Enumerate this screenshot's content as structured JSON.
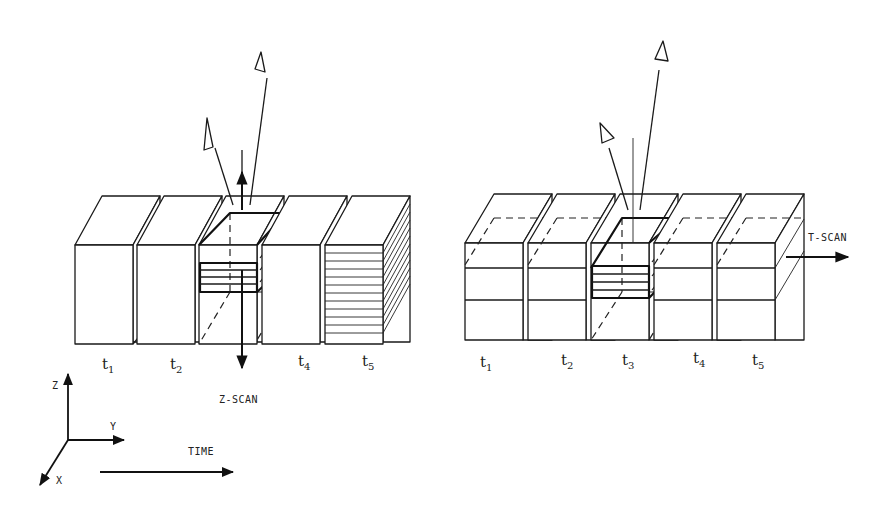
{
  "figure": {
    "left_panel": {
      "name": "z-scan",
      "scan_label": "Z-SCAN",
      "time_labels": [
        {
          "base": "t",
          "sub": "1"
        },
        {
          "base": "t",
          "sub": "2"
        },
        {
          "base": "t",
          "sub": "3"
        },
        {
          "base": "t",
          "sub": "4"
        },
        {
          "base": "t",
          "sub": "5"
        }
      ],
      "visible_time_labels": [
        "t1",
        "t2",
        "t4",
        "t5"
      ],
      "block_count": 5,
      "highlighted_block": 3,
      "viewer_count": 2
    },
    "right_panel": {
      "name": "t-scan",
      "scan_label": "T-SCAN",
      "time_labels": [
        {
          "base": "t",
          "sub": "1"
        },
        {
          "base": "t",
          "sub": "2"
        },
        {
          "base": "t",
          "sub": "3"
        },
        {
          "base": "t",
          "sub": "4"
        },
        {
          "base": "t",
          "sub": "5"
        }
      ],
      "block_count": 5,
      "highlighted_block": 3,
      "viewer_count": 2
    },
    "axes": {
      "z_label": "Z",
      "y_label": "Y",
      "x_label": "X",
      "time_label": "TIME"
    },
    "colors": {
      "ink": "#1a1a1a",
      "paper": "#ffffff"
    }
  }
}
